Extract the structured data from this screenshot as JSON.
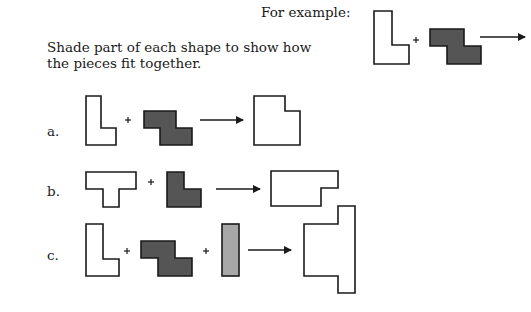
{
  "example_label": "For example:",
  "instructions": {
    "line1": "Shade part of each shape to show how",
    "line2": "the pieces fit together."
  },
  "problems": [
    {
      "label": "a."
    },
    {
      "label": "b."
    },
    {
      "label": "c."
    }
  ],
  "symbols": {
    "plus": "+"
  },
  "colors": {
    "outline": "#1a1a1a",
    "dark_piece": "#555555",
    "light_piece": "#a8a8a8",
    "empty": "#ffffff"
  }
}
